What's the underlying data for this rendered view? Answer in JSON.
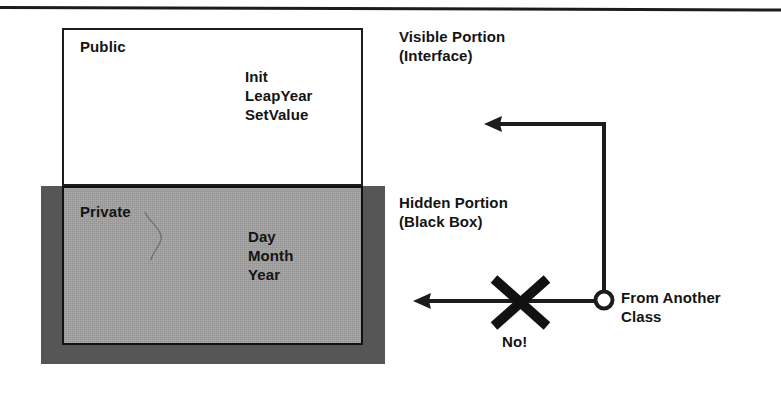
{
  "diagram": {
    "title_rule": "",
    "public_section": {
      "name": "Public",
      "members": "Init\nLeapYear\nSetValue"
    },
    "private_section": {
      "name": "Private",
      "members": "Day\nMonth\nYear"
    },
    "annotations": {
      "visible_portion": "Visible Portion\n(Interface)",
      "hidden_portion": "Hidden Portion\n(Black Box)",
      "from_another_class": "From Another\nClass",
      "forbidden": "No!"
    },
    "colors": {
      "ink": "#141414",
      "private_fill": "#9d9d9d",
      "frame_shadow": "#565656",
      "public_fill": "#ffffff",
      "page": "#ffffff"
    }
  }
}
